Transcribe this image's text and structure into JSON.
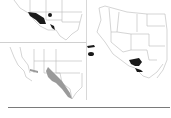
{
  "figure": {
    "panels": [
      {
        "id": "top-left",
        "region": "Southwest US (AZ, NM, TX)",
        "fill": "#1a1a1a",
        "shape": "solid black range"
      },
      {
        "id": "right",
        "region": "Western US",
        "fill": "#1a1a1a",
        "shape": "scattered black patches"
      },
      {
        "id": "bottom-left",
        "region": "Southwest US",
        "fill": "#9a9a9a",
        "shape": "grey range band"
      }
    ],
    "colors": {
      "border": "#b8b8b8",
      "range_dark": "#1a1a1a",
      "range_grey": "#9a9a9a",
      "divider": "#7a7a7a"
    }
  }
}
